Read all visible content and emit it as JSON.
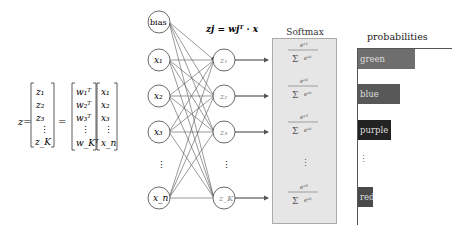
{
  "equation": {
    "lhs": "z",
    "z_vector": [
      "z1",
      "z2",
      "z3",
      "⋮",
      "zK"
    ],
    "w_matrix": [
      "w1ᵀ",
      "w2ᵀ",
      "w3ᵀ",
      "⋮",
      "wKᵀ"
    ],
    "x_vector": [
      "x1",
      "x2",
      "x3",
      "⋮",
      "xn"
    ]
  },
  "network": {
    "formula": "zj = wjᵀ · x",
    "input_nodes": [
      "bias",
      "x1",
      "x2",
      "x3",
      "⋮",
      "xn"
    ],
    "output_nodes": [
      "z1",
      "z2",
      "z3",
      "⋮",
      "zK"
    ]
  },
  "softmax": {
    "title": "Softmax",
    "entries": [
      "e^z1 / Σ_{k=1}^{K} e^zk",
      "e^z2 / Σ_{k=1}^{K} e^zk",
      "e^z3 / Σ_{k=1}^{K} e^zk",
      "⋮",
      "e^zK / Σ_{k=1}^{K} e^zk"
    ]
  },
  "probabilities": {
    "title": "probabilities",
    "bars": [
      {
        "label": "green",
        "color": "#6e6e6e",
        "width": 55
      },
      {
        "label": "blue",
        "color": "#585858",
        "width": 42
      },
      {
        "label": "purple",
        "color": "#222222",
        "width": 33
      },
      {
        "label": "⋮",
        "color": null,
        "width": 0
      },
      {
        "label": "red",
        "color": "#4a4a4a",
        "width": 15
      }
    ]
  }
}
